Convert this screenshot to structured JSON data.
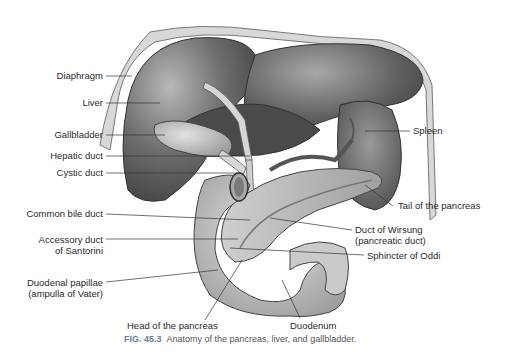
{
  "figure": {
    "number": "FIG. 45.3",
    "caption": "Anatomy of the pancreas, liver, and gallbladder."
  },
  "labels": {
    "left": [
      {
        "text": "Diaphragm"
      },
      {
        "text": "Liver"
      },
      {
        "text": "Gallbladder"
      },
      {
        "text": "Hepatic duct"
      },
      {
        "text": "Cystic duct"
      },
      {
        "text": "Common bile duct"
      },
      {
        "line1": "Accessory duct",
        "line2": "of Santorini"
      },
      {
        "line1": "Duodenal papillae",
        "line2": "(ampulla of Vater)"
      }
    ],
    "right": [
      {
        "text": "Spleen"
      },
      {
        "text": "Tail of the pancreas"
      },
      {
        "line1": "Duct of Wirsung",
        "line2": "(pancreatic duct)"
      },
      {
        "text": "Sphincter of Oddi"
      }
    ],
    "bottom": [
      {
        "text": "Head of the pancreas"
      },
      {
        "text": "Duodenum"
      }
    ]
  },
  "colors": {
    "fig_label": "#6a7f99",
    "organ_dark": "#5a5a5a",
    "organ_mid": "#8c8c8c",
    "organ_light": "#c8c8c8",
    "leader_line": "#333333"
  }
}
